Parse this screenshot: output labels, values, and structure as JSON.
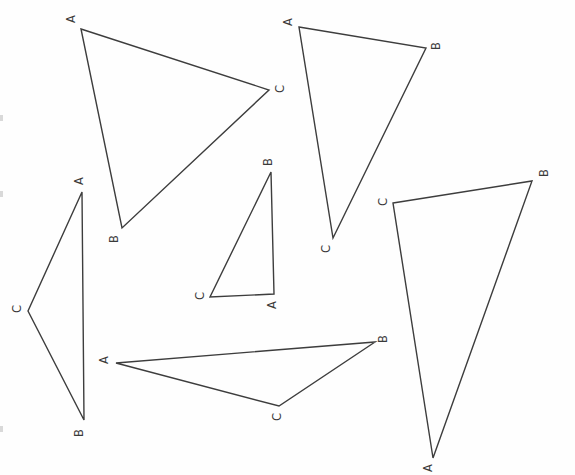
{
  "style": {
    "background_color": "#fefefe",
    "line_color": "#3d3d3d",
    "line_width": 1.4,
    "label_color": "#3a3a3a",
    "label_rotation_deg": -90,
    "scan_mark_color": "#b9b9b9"
  },
  "triangles": [
    {
      "id": "triangle-top-left",
      "vertices": [
        {
          "label": "A",
          "x": 81,
          "y": 29,
          "lx": 71,
          "ly": 19
        },
        {
          "label": "C",
          "x": 269,
          "y": 90,
          "lx": 280,
          "ly": 89
        },
        {
          "label": "B",
          "x": 122,
          "y": 228,
          "lx": 114,
          "ly": 239
        }
      ]
    },
    {
      "id": "triangle-top-right",
      "vertices": [
        {
          "label": "A",
          "x": 299,
          "y": 27,
          "lx": 288,
          "ly": 22
        },
        {
          "label": "B",
          "x": 426,
          "y": 48,
          "lx": 436,
          "ly": 46
        },
        {
          "label": "C",
          "x": 333,
          "y": 238,
          "lx": 326,
          "ly": 249
        }
      ]
    },
    {
      "id": "triangle-left-tall",
      "vertices": [
        {
          "label": "A",
          "x": 82,
          "y": 192,
          "lx": 79,
          "ly": 181
        },
        {
          "label": "C",
          "x": 28,
          "y": 311,
          "lx": 17,
          "ly": 309
        },
        {
          "label": "B",
          "x": 84,
          "y": 420,
          "lx": 79,
          "ly": 433
        }
      ]
    },
    {
      "id": "triangle-middle-small",
      "vertices": [
        {
          "label": "B",
          "x": 271,
          "y": 172,
          "lx": 268,
          "ly": 162
        },
        {
          "label": "A",
          "x": 274,
          "y": 294,
          "lx": 272,
          "ly": 305
        },
        {
          "label": "C",
          "x": 210,
          "y": 297,
          "lx": 200,
          "ly": 296
        }
      ]
    },
    {
      "id": "triangle-bottom-wide",
      "vertices": [
        {
          "label": "A",
          "x": 116,
          "y": 363,
          "lx": 104,
          "ly": 360
        },
        {
          "label": "B",
          "x": 375,
          "y": 342,
          "lx": 383,
          "ly": 339
        },
        {
          "label": "C",
          "x": 279,
          "y": 406,
          "lx": 277,
          "ly": 417
        }
      ]
    },
    {
      "id": "triangle-right-large",
      "vertices": [
        {
          "label": "C",
          "x": 393,
          "y": 203,
          "lx": 383,
          "ly": 202
        },
        {
          "label": "B",
          "x": 532,
          "y": 181,
          "lx": 544,
          "ly": 173
        },
        {
          "label": "A",
          "x": 433,
          "y": 458,
          "lx": 428,
          "ly": 468
        }
      ]
    }
  ],
  "scan_marks": [
    {
      "x": 0,
      "y": 115,
      "w": 3,
      "h": 6
    },
    {
      "x": 0,
      "y": 191,
      "w": 3,
      "h": 6
    },
    {
      "x": 0,
      "y": 426,
      "w": 3,
      "h": 6
    }
  ]
}
